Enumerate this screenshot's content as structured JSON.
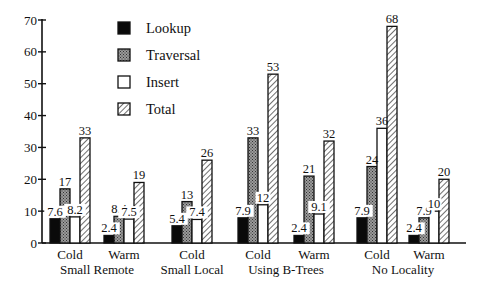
{
  "chart_data": {
    "type": "bar",
    "title": "",
    "xlabel": "",
    "ylabel": "",
    "ylim": [
      0,
      70
    ],
    "yticks": [
      0,
      10,
      20,
      30,
      40,
      50,
      60,
      70
    ],
    "grid": false,
    "legend_position": "top-center",
    "groups": [
      {
        "label": "Small Remote",
        "subgroups": [
          "Cold",
          "Warm"
        ]
      },
      {
        "label": "Small Local",
        "subgroups": [
          "Cold"
        ]
      },
      {
        "label": "Using B-Trees",
        "subgroups": [
          "Cold",
          "Warm"
        ]
      },
      {
        "label": "No Locality",
        "subgroups": [
          "Cold",
          "Warm"
        ]
      }
    ],
    "categories": [
      "Small Remote Cold",
      "Small Remote Warm",
      "Small Local Cold",
      "Using B-Trees Cold",
      "Using B-Trees Warm",
      "No Locality Cold",
      "No Locality Warm"
    ],
    "series": [
      {
        "name": "Lookup",
        "pattern": "solid-black",
        "values": [
          7.6,
          2.4,
          5.4,
          7.9,
          2.4,
          7.9,
          2.4
        ],
        "labels": [
          "7.6",
          "2.4",
          "5.4",
          "7.9",
          "2.4",
          "7.9",
          "2.4"
        ]
      },
      {
        "name": "Traversal",
        "pattern": "stipple-gray",
        "values": [
          17,
          8.4,
          13,
          33,
          21,
          24,
          7.9
        ],
        "labels": [
          "17",
          "8.4",
          "13",
          "33",
          "21",
          "24",
          "7.9"
        ]
      },
      {
        "name": "Insert",
        "pattern": "white",
        "values": [
          8.2,
          7.5,
          7.4,
          12,
          9.1,
          36,
          10
        ],
        "labels": [
          "8.2",
          "7.5",
          "7.4",
          "12",
          "9.1",
          "36",
          "10"
        ]
      },
      {
        "name": "Total",
        "pattern": "diagonal-hatch",
        "values": [
          33,
          19,
          26,
          53,
          32,
          68,
          20
        ],
        "labels": [
          "33",
          "19",
          "26",
          "53",
          "32",
          "68",
          "20"
        ]
      }
    ]
  }
}
